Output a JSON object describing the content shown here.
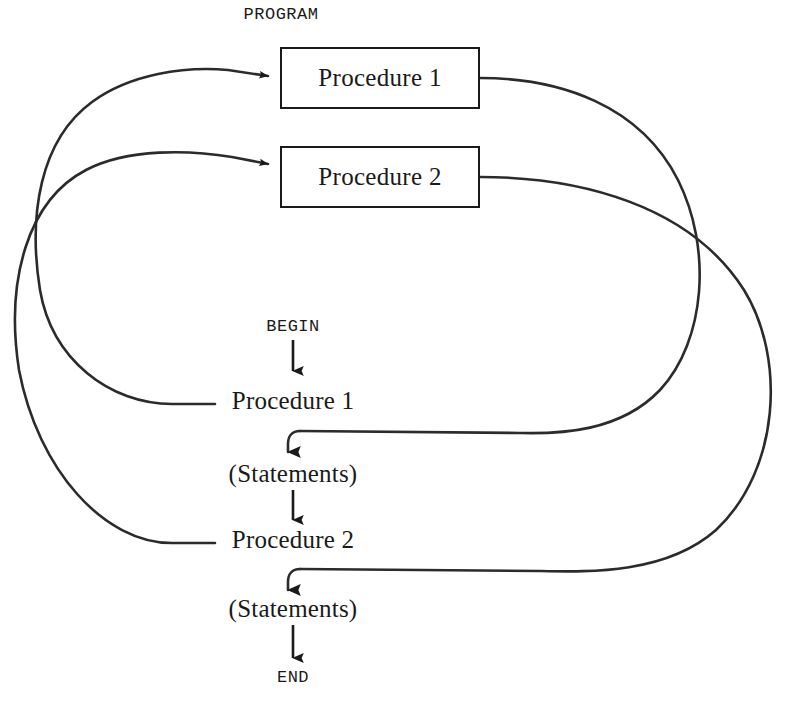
{
  "diagram": {
    "title": "PROGRAM",
    "type": "program-procedure-call-flow",
    "procedure_boxes": [
      {
        "id": "proc1-box",
        "label": "Procedure 1"
      },
      {
        "id": "proc2-box",
        "label": "Procedure 2"
      }
    ],
    "main_flow": [
      {
        "id": "begin",
        "label": "BEGIN",
        "style": "mono"
      },
      {
        "id": "call-proc1",
        "label": "Procedure 1",
        "style": "serif"
      },
      {
        "id": "statements-1",
        "label": "(Statements)",
        "style": "serif"
      },
      {
        "id": "call-proc2",
        "label": "Procedure 2",
        "style": "serif"
      },
      {
        "id": "statements-2",
        "label": "(Statements)",
        "style": "serif"
      },
      {
        "id": "end",
        "label": "END",
        "style": "mono"
      }
    ],
    "connectors": [
      {
        "id": "call-edge-proc1",
        "from": "call-proc1",
        "to": "proc1-box",
        "kind": "curve-left",
        "arrow": true
      },
      {
        "id": "call-edge-proc2",
        "from": "call-proc2",
        "to": "proc2-box",
        "kind": "curve-left",
        "arrow": true
      },
      {
        "id": "return-edge-proc1",
        "from": "proc1-box",
        "to": "statements-1",
        "kind": "curve-right",
        "arrow": true
      },
      {
        "id": "return-edge-proc2",
        "from": "proc2-box",
        "to": "statements-2",
        "kind": "curve-right",
        "arrow": true
      },
      {
        "id": "flow-begin-proc1",
        "from": "begin",
        "to": "call-proc1",
        "kind": "vertical",
        "arrow": true
      },
      {
        "id": "flow-statements1-proc2",
        "from": "statements-1",
        "to": "call-proc2",
        "kind": "vertical",
        "arrow": true
      },
      {
        "id": "flow-statements2-end",
        "from": "statements-2",
        "to": "end",
        "kind": "vertical",
        "arrow": true
      }
    ],
    "colors": {
      "stroke": "#1a1a1a",
      "curve_stroke": "#2b2b2b",
      "background": "#ffffff",
      "text": "#1a1a1a"
    }
  }
}
